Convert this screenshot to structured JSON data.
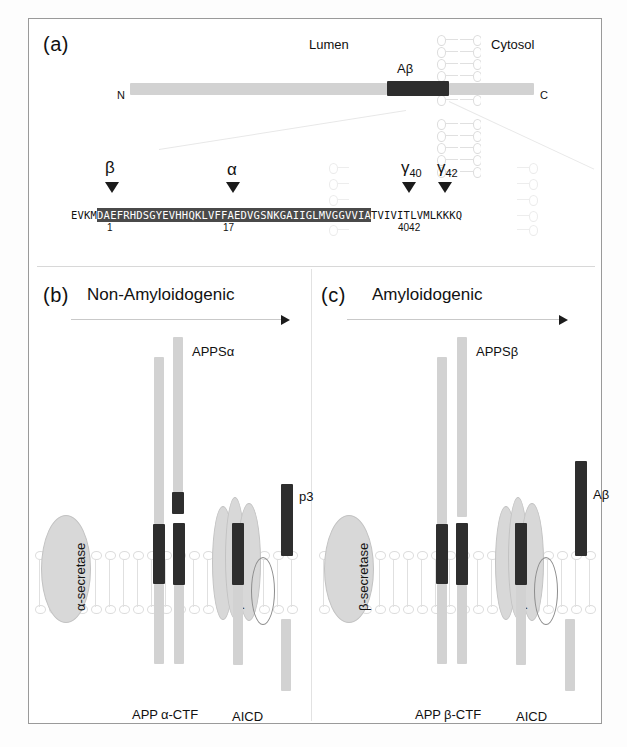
{
  "figure": {
    "panel_a": {
      "letter": "(a)",
      "compartment_left": "Lumen",
      "compartment_right": "Cytosol",
      "terminus_n": "N",
      "terminus_c": "C",
      "abeta_label": "Aβ",
      "cleavage_sites": [
        {
          "name": "beta",
          "label": "β",
          "sub": ""
        },
        {
          "name": "alpha",
          "label": "α",
          "sub": ""
        },
        {
          "name": "gamma40",
          "label": "γ",
          "sub": "40"
        },
        {
          "name": "gamma42",
          "label": "γ",
          "sub": "42"
        }
      ],
      "sequence": {
        "prefix": "EVKM",
        "highlighted": "DAEFRHDSGYEVHHQKLVFFAEDVGSNKGAIIGLMVGGVVIA",
        "suffix": "TVIVITLVMLKKKQ",
        "position_labels": [
          "1",
          "17",
          "40",
          "42"
        ],
        "residue_1": "1",
        "residue_17": "17",
        "residue_4042": "4042"
      }
    },
    "panel_b": {
      "letter": "(b)",
      "title": "Non-Amyloidogenic",
      "secretase_1": "α-secretase",
      "secretase_2": "γ-secretase",
      "products": {
        "ectodomain": "APPSα",
        "peptide": "p3",
        "full_length": "APP",
        "ctf": "α-CTF",
        "icd": "AICD"
      }
    },
    "panel_c": {
      "letter": "(c)",
      "title": "Amyloidogenic",
      "secretase_1": "β-secretase",
      "secretase_2": "γ-secretase",
      "products": {
        "ectodomain": "APPSβ",
        "peptide": "Aβ",
        "full_length": "APP",
        "ctf": "β-CTF",
        "icd": "AICD"
      }
    },
    "colors": {
      "protein_light": "#d2d2d2",
      "abeta_dark": "#2e2e2e",
      "secretase_fill": "#d8d8d8",
      "membrane": "#e0e0e0",
      "highlight_bg": "#4a4a4a"
    }
  }
}
